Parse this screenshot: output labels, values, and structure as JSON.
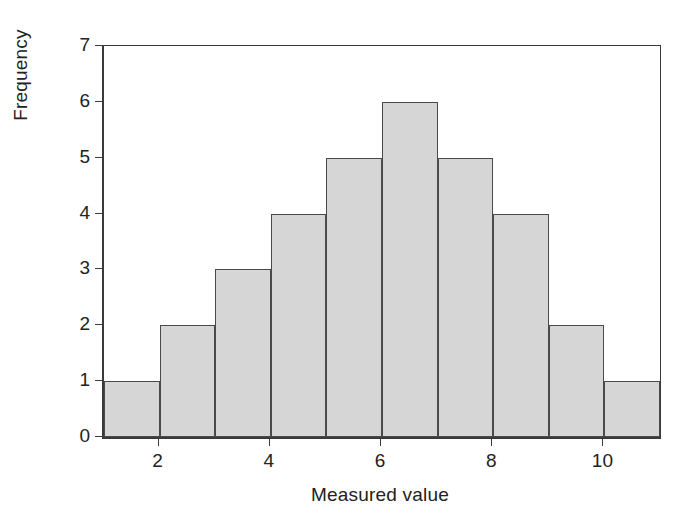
{
  "chart_data": {
    "type": "bar",
    "title": "",
    "xlabel": "Measured value",
    "ylabel": "Frequency",
    "bin_edges": [
      1,
      2,
      3,
      4,
      5,
      6,
      7,
      8,
      9,
      10,
      11
    ],
    "categories": [
      "1-2",
      "2-3",
      "3-4",
      "4-5",
      "5-6",
      "6-7",
      "7-8",
      "8-9",
      "9-10",
      "10-11"
    ],
    "values": [
      1,
      2,
      3,
      4,
      5,
      6,
      5,
      4,
      2,
      1
    ],
    "xlim": [
      1,
      11
    ],
    "ylim": [
      0,
      7
    ],
    "xticks": [
      2,
      4,
      6,
      8,
      10
    ],
    "xtick_labels": [
      "2",
      "4",
      "6",
      "8",
      "10"
    ],
    "yticks": [
      0,
      1,
      2,
      3,
      4,
      5,
      6,
      7
    ],
    "ytick_labels": [
      "0",
      "1",
      "2",
      "3",
      "4",
      "5",
      "6",
      "7"
    ],
    "grid": false,
    "legend": null,
    "bar_fill_color": "#d6d6d6",
    "bar_edge_color": "#4a4a4a",
    "axis_color": "#3a3a3a",
    "background_color": "#ffffff"
  }
}
